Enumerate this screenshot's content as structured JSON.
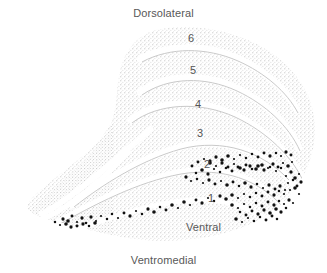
{
  "figure": {
    "title_kind": "lgn-coronal-section-diagram",
    "orientation_labels": {
      "top": "Dorsolateral",
      "bottom": "Ventromedial",
      "inner": "Ventral"
    },
    "layer_labels": [
      {
        "id": "layer-6",
        "text": "6",
        "x": 188,
        "y": 33
      },
      {
        "id": "layer-5",
        "text": "5",
        "x": 190,
        "y": 65
      },
      {
        "id": "layer-4",
        "text": "4",
        "x": 195,
        "y": 99
      },
      {
        "id": "layer-3",
        "text": "3",
        "x": 197,
        "y": 128
      },
      {
        "id": "layer-2",
        "text": "2",
        "x": 204,
        "y": 159
      },
      {
        "id": "layer-1",
        "text": "1",
        "x": 208,
        "y": 193
      }
    ],
    "colors": {
      "background": "#ffffff",
      "tissue_stipple": "#b9b9b9",
      "lamina_gap": "#ffffff",
      "labeled_cell": "#121212",
      "text": "#585858"
    },
    "legend_note": "",
    "cell_marker_shape": "dot",
    "cell_marker_layers": [
      "1",
      "2"
    ]
  },
  "chart_data": {
    "type": "scatter",
    "title": "",
    "xlabel": "",
    "ylabel": "",
    "series": [
      {
        "name": "labeled cells",
        "color": "#121212",
        "points": [
          [
            63,
            219
          ],
          [
            68,
            221
          ],
          [
            72,
            216
          ],
          [
            77,
            222
          ],
          [
            82,
            218
          ],
          [
            86,
            223
          ],
          [
            91,
            217
          ],
          [
            96,
            221
          ],
          [
            101,
            216
          ],
          [
            107,
            219
          ],
          [
            112,
            214
          ],
          [
            118,
            218
          ],
          [
            124,
            213
          ],
          [
            130,
            216
          ],
          [
            136,
            211
          ],
          [
            142,
            214
          ],
          [
            148,
            209
          ],
          [
            154,
            212
          ],
          [
            160,
            207
          ],
          [
            166,
            210
          ],
          [
            172,
            205
          ],
          [
            178,
            208
          ],
          [
            184,
            202
          ],
          [
            190,
            205
          ],
          [
            196,
            200
          ],
          [
            202,
            203
          ],
          [
            208,
            198
          ],
          [
            214,
            201
          ],
          [
            220,
            196
          ],
          [
            226,
            199
          ],
          [
            232,
            195
          ],
          [
            238,
            198
          ],
          [
            244,
            194
          ],
          [
            250,
            197
          ],
          [
            256,
            193
          ],
          [
            262,
            196
          ],
          [
            268,
            192
          ],
          [
            274,
            195
          ],
          [
            279,
            191
          ],
          [
            284,
            194
          ],
          [
            196,
            173
          ],
          [
            202,
            170
          ],
          [
            208,
            174
          ],
          [
            214,
            169
          ],
          [
            220,
            172
          ],
          [
            226,
            168
          ],
          [
            232,
            171
          ],
          [
            238,
            167
          ],
          [
            244,
            170
          ],
          [
            250,
            166
          ],
          [
            256,
            169
          ],
          [
            262,
            165
          ],
          [
            268,
            168
          ],
          [
            273,
            164
          ],
          [
            278,
            167
          ],
          [
            283,
            163
          ],
          [
            288,
            166
          ],
          [
            292,
            162
          ],
          [
            186,
            177
          ],
          [
            191,
            181
          ],
          [
            197,
            179
          ],
          [
            203,
            183
          ],
          [
            209,
            180
          ],
          [
            215,
            184
          ],
          [
            221,
            181
          ],
          [
            227,
            185
          ],
          [
            233,
            182
          ],
          [
            239,
            186
          ],
          [
            245,
            183
          ],
          [
            251,
            187
          ],
          [
            257,
            184
          ],
          [
            263,
            188
          ],
          [
            269,
            185
          ],
          [
            275,
            189
          ],
          [
            280,
            186
          ],
          [
            285,
            190
          ],
          [
            192,
            166
          ],
          [
            198,
            162
          ],
          [
            204,
            159
          ],
          [
            210,
            161
          ],
          [
            216,
            157
          ],
          [
            222,
            160
          ],
          [
            228,
            156
          ],
          [
            234,
            159
          ],
          [
            240,
            155
          ],
          [
            246,
            158
          ],
          [
            252,
            154
          ],
          [
            258,
            157
          ],
          [
            264,
            153
          ],
          [
            270,
            156
          ],
          [
            276,
            153
          ],
          [
            281,
            156
          ],
          [
            286,
            152
          ],
          [
            291,
            155
          ],
          [
            210,
            163
          ],
          [
            216,
            166
          ],
          [
            222,
            163
          ],
          [
            228,
            167
          ],
          [
            234,
            164
          ],
          [
            240,
            168
          ],
          [
            246,
            165
          ],
          [
            252,
            169
          ],
          [
            258,
            166
          ],
          [
            264,
            170
          ],
          [
            270,
            167
          ],
          [
            276,
            171
          ],
          [
            281,
            168
          ],
          [
            232,
            205
          ],
          [
            238,
            208
          ],
          [
            244,
            204
          ],
          [
            250,
            207
          ],
          [
            256,
            203
          ],
          [
            262,
            206
          ],
          [
            268,
            202
          ],
          [
            274,
            205
          ],
          [
            279,
            201
          ],
          [
            284,
            204
          ],
          [
            289,
            200
          ],
          [
            293,
            203
          ],
          [
            240,
            212
          ],
          [
            246,
            215
          ],
          [
            252,
            211
          ],
          [
            258,
            214
          ],
          [
            264,
            210
          ],
          [
            270,
            213
          ],
          [
            276,
            209
          ],
          [
            281,
            212
          ],
          [
            286,
            208
          ],
          [
            236,
            219
          ],
          [
            242,
            222
          ],
          [
            248,
            218
          ],
          [
            254,
            221
          ],
          [
            260,
            217
          ],
          [
            266,
            220
          ],
          [
            272,
            216
          ],
          [
            277,
            219
          ],
          [
            286,
            176
          ],
          [
            291,
            172
          ],
          [
            295,
            178
          ],
          [
            299,
            174
          ],
          [
            288,
            183
          ],
          [
            293,
            180
          ],
          [
            297,
            186
          ],
          [
            301,
            182
          ],
          [
            290,
            190
          ],
          [
            295,
            188
          ],
          [
            299,
            194
          ],
          [
            55,
            222
          ],
          [
            60,
            225
          ],
          [
            66,
            224
          ],
          [
            71,
            227
          ],
          [
            77,
            226
          ],
          [
            83,
            224
          ],
          [
            89,
            226
          ],
          [
            95,
            223
          ]
        ]
      }
    ]
  }
}
